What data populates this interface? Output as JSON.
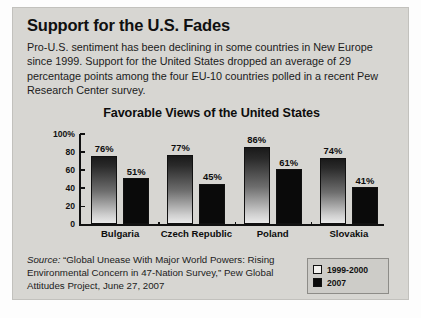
{
  "card": {
    "headline": "Support for the U.S. Fades",
    "blurb": "Pro-U.S. sentiment has been declining in some countries in New Europe since 1999. Support for the United States dropped an average of 29 percentage points among the four EU-10 countries polled in a recent Pew Research Center survey."
  },
  "source": {
    "label": "Source:",
    "text": "“Global Unease With Major World Powers: Rising Environmental Concern in 47-Nation Survey,” Pew Global Attitudes Project, June 27, 2007"
  },
  "legend": {
    "items": [
      {
        "label": "1999-2000",
        "swatch": "s1"
      },
      {
        "label": "2007",
        "swatch": "s2"
      }
    ]
  },
  "chart_data": {
    "type": "bar",
    "title": "Favorable Views of the United States",
    "xlabel": "",
    "ylabel": "",
    "ylim": [
      0,
      100
    ],
    "yticks": [
      0,
      20,
      40,
      60,
      80,
      100
    ],
    "ytick_labels": [
      "0",
      "20",
      "40",
      "60",
      "80",
      "100%"
    ],
    "grid": false,
    "legend_position": "bottom-right",
    "categories": [
      "Bulgaria",
      "Czech Republic",
      "Poland",
      "Slovakia"
    ],
    "series": [
      {
        "name": "1999-2000",
        "values": [
          76,
          77,
          86,
          74
        ],
        "value_labels": [
          "76%",
          "77%",
          "86%",
          "74%"
        ],
        "color": "#2a2a2a"
      },
      {
        "name": "2007",
        "values": [
          51,
          45,
          61,
          41
        ],
        "value_labels": [
          "51%",
          "45%",
          "61%",
          "41%"
        ],
        "color": "#0a0a0a"
      }
    ]
  }
}
